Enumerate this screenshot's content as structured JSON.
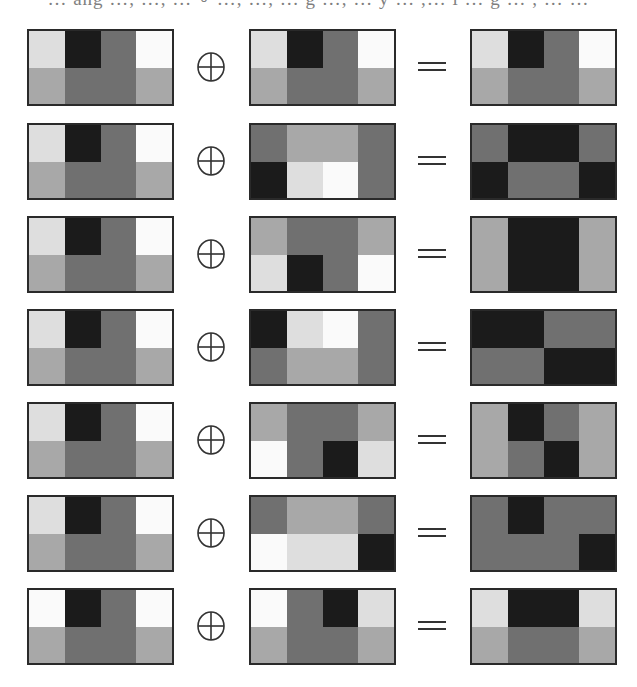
{
  "figure": {
    "caption_fragment": "… ang …, …, … ∘ …, …, … g …, … y … ,… l … g … , … …",
    "operator_symbol": "⊕",
    "equals_symbol": "=",
    "operator_icon": "circled-plus-icon",
    "equals_icon": "equals-icon",
    "palette": {
      "W": "#fafafa",
      "L": "#dedede",
      "A": "#a8a8a8",
      "M": "#707070",
      "D": "#1b1b1b"
    },
    "legend": {
      "W": "white",
      "L": "light gray",
      "A": "medium-light gray",
      "M": "medium-dark gray",
      "D": "near black"
    },
    "border_color": "#2a2a2a",
    "grid_shape": [
      2,
      4
    ],
    "rows": [
      {
        "left": [
          [
            "L",
            "D",
            "M",
            "W"
          ],
          [
            "A",
            "M",
            "M",
            "A"
          ]
        ],
        "mid": [
          [
            "L",
            "D",
            "M",
            "W"
          ],
          [
            "A",
            "M",
            "M",
            "A"
          ]
        ],
        "right": [
          [
            "L",
            "D",
            "M",
            "W"
          ],
          [
            "A",
            "M",
            "M",
            "A"
          ]
        ]
      },
      {
        "left": [
          [
            "L",
            "D",
            "M",
            "W"
          ],
          [
            "A",
            "M",
            "M",
            "A"
          ]
        ],
        "mid": [
          [
            "M",
            "A",
            "A",
            "M"
          ],
          [
            "D",
            "L",
            "W",
            "M"
          ]
        ],
        "right": [
          [
            "M",
            "D",
            "D",
            "M"
          ],
          [
            "D",
            "M",
            "M",
            "D"
          ]
        ]
      },
      {
        "left": [
          [
            "L",
            "D",
            "M",
            "W"
          ],
          [
            "A",
            "M",
            "M",
            "A"
          ]
        ],
        "mid": [
          [
            "A",
            "M",
            "M",
            "A"
          ],
          [
            "L",
            "D",
            "M",
            "W"
          ]
        ],
        "right": [
          [
            "A",
            "D",
            "D",
            "A"
          ],
          [
            "A",
            "D",
            "D",
            "A"
          ]
        ]
      },
      {
        "left": [
          [
            "L",
            "D",
            "M",
            "W"
          ],
          [
            "A",
            "M",
            "M",
            "A"
          ]
        ],
        "mid": [
          [
            "D",
            "L",
            "W",
            "M"
          ],
          [
            "M",
            "A",
            "A",
            "M"
          ]
        ],
        "right": [
          [
            "D",
            "D",
            "M",
            "M"
          ],
          [
            "M",
            "M",
            "D",
            "D"
          ]
        ]
      },
      {
        "left": [
          [
            "L",
            "D",
            "M",
            "W"
          ],
          [
            "A",
            "M",
            "M",
            "A"
          ]
        ],
        "mid": [
          [
            "A",
            "M",
            "M",
            "A"
          ],
          [
            "W",
            "M",
            "D",
            "L"
          ]
        ],
        "right": [
          [
            "A",
            "D",
            "M",
            "A"
          ],
          [
            "A",
            "M",
            "D",
            "A"
          ]
        ]
      },
      {
        "left": [
          [
            "L",
            "D",
            "M",
            "W"
          ],
          [
            "A",
            "M",
            "M",
            "A"
          ]
        ],
        "mid": [
          [
            "M",
            "A",
            "A",
            "M"
          ],
          [
            "W",
            "L",
            "L",
            "D"
          ]
        ],
        "right": [
          [
            "M",
            "D",
            "M",
            "M"
          ],
          [
            "M",
            "M",
            "M",
            "D"
          ]
        ]
      },
      {
        "left": [
          [
            "W",
            "D",
            "M",
            "W"
          ],
          [
            "A",
            "M",
            "M",
            "A"
          ]
        ],
        "mid": [
          [
            "W",
            "M",
            "D",
            "L"
          ],
          [
            "A",
            "M",
            "M",
            "A"
          ]
        ],
        "right": [
          [
            "L",
            "D",
            "D",
            "L"
          ],
          [
            "A",
            "M",
            "M",
            "A"
          ]
        ]
      }
    ]
  }
}
